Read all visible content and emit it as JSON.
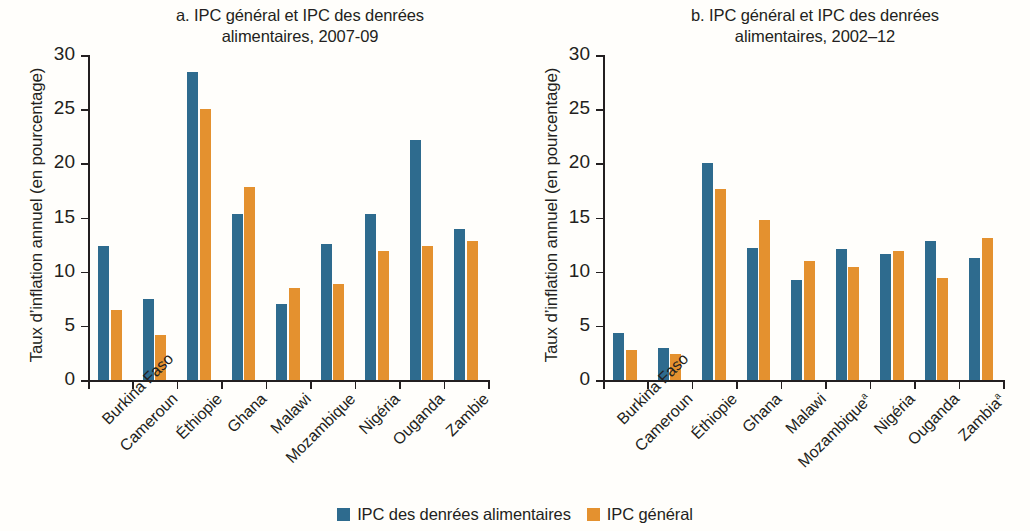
{
  "chart_data": [
    {
      "type": "bar",
      "panel_id": "a",
      "title": "a. IPC général et IPC des denrées alimentaires, 2007-09",
      "title_line1": "a. IPC général et IPC des denrées",
      "title_line2": "alimentaires, 2007-09",
      "xlabel": "",
      "ylabel": "Taux d’inflation annuel (en pourcentage)",
      "ylim": [
        0,
        30
      ],
      "yticks": [
        0,
        5,
        10,
        15,
        20,
        25,
        30
      ],
      "ytick_labels": [
        "0",
        "5",
        "10",
        "15",
        "20",
        "25",
        "30"
      ],
      "grid": false,
      "legend_position": "bottom-center",
      "categories": [
        "Burkina Faso",
        "Cameroun",
        "Éthiopie",
        "Ghana",
        "Malawi",
        "Mozambique",
        "Nigéria",
        "Ouganda",
        "Zambie"
      ],
      "category_notes": [
        "",
        "",
        "",
        "",
        "",
        "",
        "",
        "",
        ""
      ],
      "series": [
        {
          "name": "IPC des denrées alimentaires",
          "color": "#2e6b8e",
          "values": [
            12.4,
            7.5,
            28.4,
            15.3,
            7.0,
            12.6,
            15.3,
            22.2,
            13.9
          ]
        },
        {
          "name": "IPC général",
          "color": "#e4912f",
          "values": [
            6.5,
            4.2,
            25.0,
            17.8,
            8.5,
            8.9,
            11.9,
            12.4,
            12.8
          ]
        }
      ]
    },
    {
      "type": "bar",
      "panel_id": "b",
      "title": "b. IPC général et IPC des denrées alimentaires, 2002–12",
      "title_line1": "b. IPC général et IPC des denrées",
      "title_line2": "alimentaires, 2002–12",
      "xlabel": "",
      "ylabel": "Taux d’inflation annuel (en pourcentage)",
      "ylim": [
        0,
        30
      ],
      "yticks": [
        0,
        5,
        10,
        15,
        20,
        25,
        30
      ],
      "ytick_labels": [
        "0",
        "5",
        "10",
        "15",
        "20",
        "25",
        "30"
      ],
      "grid": false,
      "legend_position": "bottom-center",
      "categories": [
        "Burkina Faso",
        "Cameroun",
        "Éthiopie",
        "Ghana",
        "Malawi",
        "Mozambique",
        "Nigéria",
        "Ouganda",
        "Zambia"
      ],
      "category_notes": [
        "",
        "",
        "",
        "",
        "",
        "a",
        "",
        "",
        "a"
      ],
      "series": [
        {
          "name": "IPC des denrées alimentaires",
          "color": "#2e6b8e",
          "values": [
            4.3,
            3.0,
            20.0,
            12.2,
            9.2,
            12.1,
            11.6,
            12.8,
            11.3
          ]
        },
        {
          "name": "IPC général",
          "color": "#e4912f",
          "values": [
            2.8,
            2.4,
            17.6,
            14.8,
            11.0,
            10.4,
            11.9,
            9.4,
            13.1
          ]
        }
      ]
    }
  ],
  "legend": {
    "items": [
      {
        "label": "IPC des denrées alimentaires",
        "color": "#2e6b8e",
        "key": "food"
      },
      {
        "label": "IPC général",
        "color": "#e4912f",
        "key": "general"
      }
    ]
  },
  "colors": {
    "food": "#2e6b8e",
    "general": "#e4912f",
    "axis": "#231f20",
    "background": "#fffefb"
  }
}
